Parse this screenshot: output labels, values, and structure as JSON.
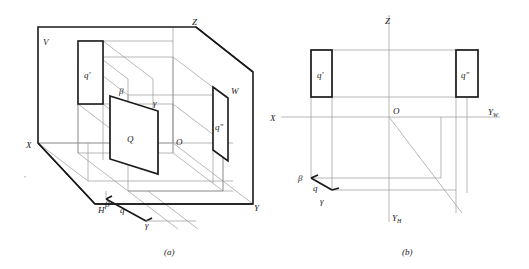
{
  "figure": {
    "background": "#ffffff",
    "line_color_heavy": "#1a1a1a",
    "line_color_light": "#9a9a9a",
    "captions": [
      {
        "id": "caption-a",
        "text": "(a)"
      },
      {
        "id": "caption-b",
        "text": "(b)"
      }
    ]
  },
  "panel_a": {
    "caption": "(a)",
    "description": "Axonometric pictorial of the V, H and W projection planes with plane Q",
    "labels": {
      "plane_v": "V",
      "plane_h": "H",
      "plane_w": "W",
      "axis_x": "X",
      "axis_y": "Y",
      "axis_z": "Z",
      "origin": "O",
      "plane_q": "Q",
      "proj_front": "q'",
      "proj_side": "q″",
      "proj_top": "q",
      "beta_upper": "β",
      "gamma_upper": "γ",
      "beta_lower": "β",
      "gamma_lower": "γ"
    }
  },
  "panel_b": {
    "caption": "(b)",
    "description": "Unfolded orthographic projection layout",
    "labels": {
      "axis_x": "X",
      "axis_z": "Z",
      "axis_yw": "Y",
      "axis_yw_sub": "W",
      "axis_yh": "Y",
      "axis_yh_sub": "H",
      "origin": "O",
      "proj_front": "q'",
      "proj_side": "q″",
      "proj_top": "q",
      "beta": "β",
      "gamma": "γ"
    }
  }
}
